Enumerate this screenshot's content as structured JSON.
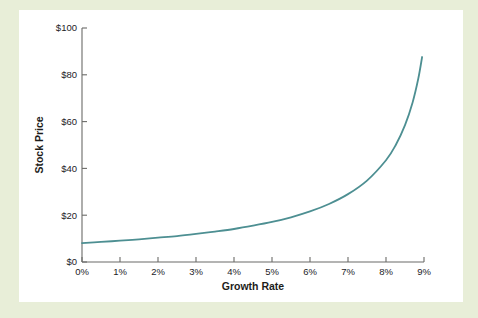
{
  "figure": {
    "background_color": "#e8eed8",
    "card_color": "#ffffff"
  },
  "chart_data": {
    "type": "line",
    "title": "",
    "xlabel": "Growth Rate",
    "ylabel": "Stock Price",
    "xtick_labels": [
      "0%",
      "1%",
      "2%",
      "3%",
      "4%",
      "5%",
      "6%",
      "7%",
      "8%",
      "9%"
    ],
    "xtick_values": [
      0,
      1,
      2,
      3,
      4,
      5,
      6,
      7,
      8,
      9
    ],
    "ytick_labels": [
      "$0",
      "$20",
      "$40",
      "$60",
      "$80",
      "$100"
    ],
    "ytick_values": [
      0,
      20,
      40,
      60,
      80,
      100
    ],
    "xlim": [
      0,
      9
    ],
    "ylim": [
      0,
      100
    ],
    "grid": false,
    "legend": false,
    "series": [
      {
        "name": "Stock Price",
        "color": "#4d8f92",
        "line_width": 1.8,
        "x": [
          0,
          0.5,
          1,
          1.5,
          2,
          2.5,
          3,
          3.5,
          4,
          4.5,
          5,
          5.5,
          6,
          6.5,
          7,
          7.5,
          8,
          8.25,
          8.5,
          8.7,
          8.85,
          8.95
        ],
        "y": [
          8.1,
          8.6,
          9.1,
          9.7,
          10.4,
          11.1,
          12.0,
          13.0,
          14.1,
          15.5,
          17.1,
          19.1,
          21.6,
          24.8,
          29.0,
          34.8,
          43.5,
          49.8,
          58.5,
          68.2,
          78.4,
          87.6
        ]
      }
    ],
    "annotations": []
  }
}
